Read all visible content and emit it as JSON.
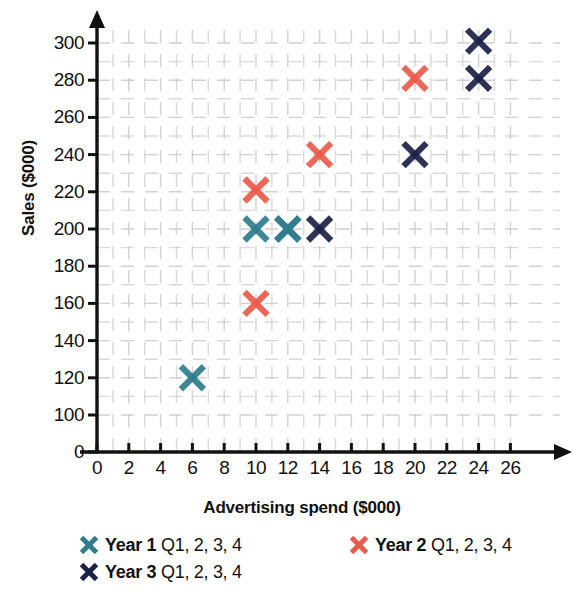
{
  "chart_data": {
    "type": "scatter",
    "title": "",
    "xlabel": "Advertising spend ($000)",
    "ylabel": "Sales ($000)",
    "xlim": [
      0,
      27
    ],
    "ylim": [
      0,
      310
    ],
    "y_axis_break": true,
    "y_break_note": "axis jumps from 0 to 100",
    "xticks": [
      "0",
      "2",
      "4",
      "6",
      "8",
      "10",
      "12",
      "14",
      "16",
      "18",
      "20",
      "22",
      "24",
      "26"
    ],
    "xtick_values": [
      0,
      2,
      4,
      6,
      8,
      10,
      12,
      14,
      16,
      18,
      20,
      22,
      24,
      26
    ],
    "yticks": [
      "0",
      "100",
      "120",
      "140",
      "160",
      "180",
      "200",
      "220",
      "240",
      "260",
      "280",
      "300"
    ],
    "ytick_values": [
      0,
      100,
      120,
      140,
      160,
      180,
      200,
      220,
      240,
      260,
      280,
      300
    ],
    "grid": true,
    "grid_style": "dashed-light-gray",
    "legend_position": "below",
    "marker": "x-cross",
    "series": [
      {
        "name": "Year 1",
        "label_bold": "Year 1",
        "label_rest": "Q1, 2, 3, 4",
        "color": "#2f7d8e",
        "points": [
          {
            "x": 6,
            "y": 120
          },
          {
            "x": 10,
            "y": 200
          },
          {
            "x": 12,
            "y": 200
          },
          {
            "x": 12,
            "y": 200
          }
        ]
      },
      {
        "name": "Year 2",
        "label_bold": "Year 2",
        "label_rest": "Q1, 2, 3, 4",
        "color": "#ec5a4b",
        "points": [
          {
            "x": 10,
            "y": 160
          },
          {
            "x": 10,
            "y": 221
          },
          {
            "x": 14,
            "y": 240
          },
          {
            "x": 20,
            "y": 281
          }
        ]
      },
      {
        "name": "Year 3",
        "label_bold": "Year 3",
        "label_rest": "Q1, 2, 3, 4",
        "color": "#1d2148",
        "points": [
          {
            "x": 14,
            "y": 200
          },
          {
            "x": 20,
            "y": 240
          },
          {
            "x": 24,
            "y": 281
          },
          {
            "x": 24,
            "y": 301
          }
        ]
      }
    ]
  },
  "axes": {
    "x_axis_label": "Advertising spend ($000)",
    "y_axis_label": "Sales ($000)"
  },
  "legend": {
    "rows": [
      [
        {
          "bold": "Year 1",
          "rest": "Q1, 2, 3, 4",
          "color": "#2f7d8e",
          "icon": "x-marker-icon"
        },
        {
          "bold": "Year 2",
          "rest": "Q1, 2, 3, 4",
          "color": "#ec5a4b",
          "icon": "x-marker-icon"
        }
      ],
      [
        {
          "bold": "Year 3",
          "rest": "Q1, 2, 3, 4",
          "color": "#1d2148",
          "icon": "x-marker-icon"
        }
      ]
    ]
  },
  "colors": {
    "year1": "#2f7d8e",
    "year2": "#ec5a4b",
    "year3": "#1d2148",
    "axis": "#111111",
    "grid": "#c9c9c9"
  }
}
